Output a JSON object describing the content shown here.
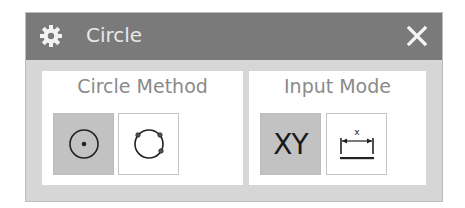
{
  "dialog": {
    "title": "Circle",
    "icon": "gear-icon",
    "close_icon": "close-icon"
  },
  "groups": [
    {
      "label": "Circle Method",
      "buttons": [
        {
          "name": "center-radius-circle",
          "icon": "circle-center-point-icon",
          "selected": true
        },
        {
          "name": "three-point-circle",
          "icon": "circle-three-points-icon",
          "selected": false
        }
      ]
    },
    {
      "label": "Input Mode",
      "buttons": [
        {
          "name": "coordinate-mode",
          "label": "XY",
          "selected": true
        },
        {
          "name": "parameter-mode",
          "icon": "dimension-parameter-icon",
          "selected": false
        }
      ]
    }
  ],
  "colors": {
    "titlebar": "#7a7a7a",
    "dialog_bg": "#d6d6d6",
    "selected_button": "#c2c2c2",
    "panel_title_text": "#8a8a8a"
  }
}
